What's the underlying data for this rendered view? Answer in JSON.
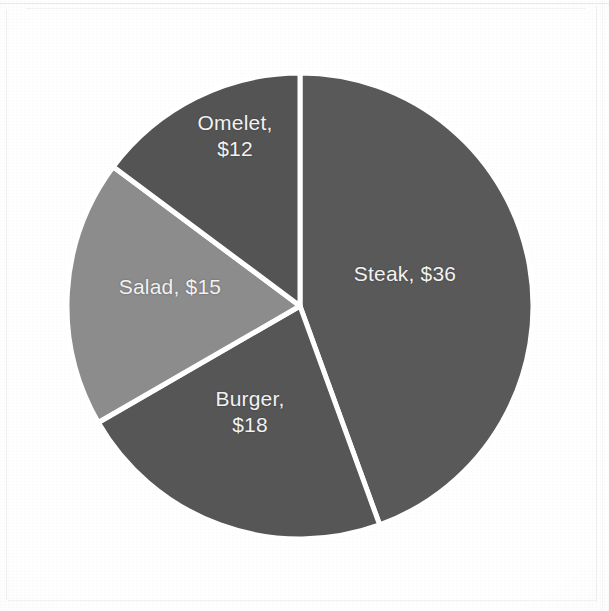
{
  "chart_data": {
    "type": "pie",
    "title": "",
    "subtitle": "",
    "xlabel": "",
    "ylabel": "",
    "legend": "none",
    "grid": false,
    "labels_inside_slices": true,
    "label_format": "name, $value",
    "total": 81,
    "categories": [
      "Steak",
      "Burger",
      "Salad",
      "Omelet"
    ],
    "values": [
      36,
      18,
      15,
      12
    ],
    "value_prefix": "$",
    "slices": [
      {
        "name": "Steak",
        "value": 36,
        "label": "Steak, $36",
        "percent": 44.4,
        "angle_deg": 160.0,
        "start_angle_deg": 0.0,
        "end_angle_deg": 160.0,
        "color": "#595959",
        "label_lines": [
          "Steak, $36"
        ]
      },
      {
        "name": "Burger",
        "value": 18,
        "label": "Burger, $18",
        "percent": 22.2,
        "angle_deg": 80.0,
        "start_angle_deg": 160.0,
        "end_angle_deg": 240.0,
        "color": "#565656",
        "label_lines": [
          "Burger,",
          "$18"
        ]
      },
      {
        "name": "Salad",
        "value": 15,
        "label": "Salad, $15",
        "percent": 18.5,
        "angle_deg": 66.7,
        "start_angle_deg": 240.0,
        "end_angle_deg": 306.7,
        "color": "#8c8c8c",
        "label_lines": [
          "Salad, $15"
        ]
      },
      {
        "name": "Omelet",
        "value": 12,
        "label": "Omelet, $12",
        "percent": 14.8,
        "angle_deg": 53.3,
        "start_angle_deg": 306.7,
        "end_angle_deg": 360.0,
        "color": "#545454",
        "label_lines": [
          "Omelet,",
          "$12"
        ]
      }
    ],
    "geometry": {
      "center_x": 300,
      "center_y": 306,
      "radius": 233,
      "separator_color": "#ffffff",
      "separator_width": 5
    },
    "background_color": "#fdfdfd",
    "label_color": "#f2f2f2"
  },
  "labels": {
    "steak": "Steak, $36",
    "burger": "Burger,\n$18",
    "salad": "Salad, $15",
    "omelet": "Omelet,\n$12"
  }
}
